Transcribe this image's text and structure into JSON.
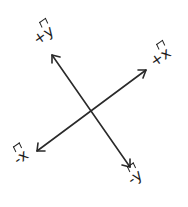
{
  "diagram": {
    "title": "",
    "line_color": "#2a2a2a",
    "background": "#ffffff",
    "origin": {
      "x": 90,
      "y": 111
    },
    "axes": [
      {
        "name": "y-axis",
        "positive_label": {
          "sign": "+",
          "symbol": "y",
          "hat": true
        },
        "negative_label": {
          "sign": "-",
          "symbol": "y",
          "hat": true
        },
        "positive_end": {
          "x": 52,
          "y": 55
        },
        "negative_end": {
          "x": 130,
          "y": 167
        }
      },
      {
        "name": "x-axis",
        "positive_label": {
          "sign": "+",
          "symbol": "x",
          "hat": true
        },
        "negative_label": {
          "sign": "-",
          "symbol": "x",
          "hat": true
        },
        "positive_end": {
          "x": 146,
          "y": 70
        },
        "negative_end": {
          "x": 37,
          "y": 151
        }
      }
    ],
    "labels": {
      "plus_y": {
        "sign": "+",
        "symbol": "y"
      },
      "plus_x": {
        "sign": "+",
        "symbol": "x"
      },
      "minus_x": {
        "sign": "-",
        "symbol": "x"
      },
      "minus_y": {
        "sign": "-",
        "symbol": "y"
      }
    }
  }
}
